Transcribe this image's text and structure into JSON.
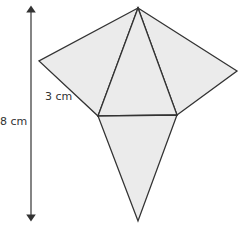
{
  "diagram": {
    "type": "square-based pyramid net",
    "labels": {
      "height": "8 cm",
      "edge": "3 cm"
    },
    "colors": {
      "fill": "#ebebeb",
      "stroke": "#333333",
      "arrow": "#333333"
    }
  }
}
